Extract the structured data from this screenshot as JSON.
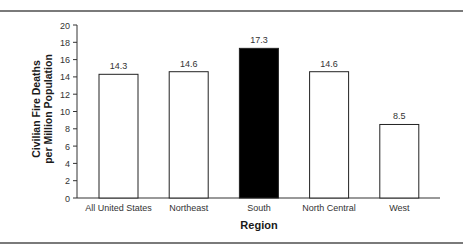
{
  "chart_data": {
    "type": "bar",
    "title": "",
    "xlabel": "Region",
    "ylabel": [
      "Civilian Fire Deaths",
      "per Million Population"
    ],
    "categories": [
      "All United States",
      "Northeast",
      "South",
      "North Central",
      "West"
    ],
    "values": [
      14.3,
      14.6,
      17.3,
      14.6,
      8.5
    ],
    "value_labels": [
      "14.3",
      "14.6",
      "17.3",
      "14.6",
      "8.5"
    ],
    "highlight_index": 2,
    "ylim": [
      0,
      20
    ],
    "yticks": [
      0,
      2,
      4,
      6,
      8,
      10,
      12,
      14,
      16,
      18,
      20
    ],
    "grid": false,
    "legend": null,
    "colors": {
      "bar_fill": "#ffffff",
      "bar_highlight": "#000000",
      "bar_stroke": "#222222",
      "axis": "#333333",
      "rule": "#7a7a7a"
    }
  }
}
